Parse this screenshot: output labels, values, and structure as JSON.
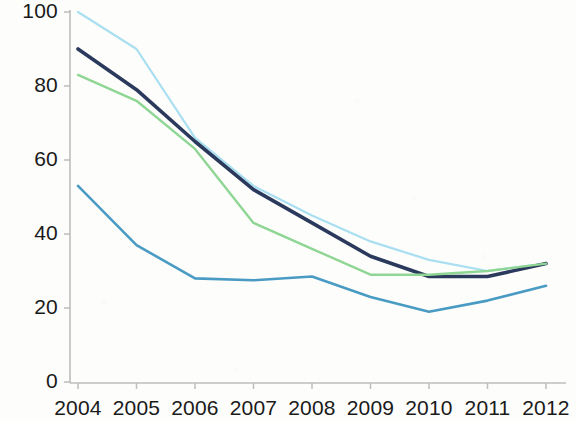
{
  "chart_data": {
    "type": "line",
    "title": "",
    "subtitle": "",
    "xlabel": "",
    "ylabel": "",
    "categories": [
      "2004",
      "2005",
      "2006",
      "2007",
      "2008",
      "2009",
      "2010",
      "2011",
      "2012"
    ],
    "x_tick_labels": [
      "2004",
      "2005",
      "2006",
      "2007",
      "2008",
      "2009",
      "2010",
      "2011",
      "2012"
    ],
    "y_tick_labels": [
      "0",
      "20",
      "40",
      "60",
      "80",
      "100"
    ],
    "y_ticks": [
      0,
      20,
      40,
      60,
      80,
      100
    ],
    "ylim": [
      0,
      100
    ],
    "xlim": [
      "2004",
      "2012"
    ],
    "grid": false,
    "legend": "none",
    "legend_position": "none",
    "annotations": [],
    "series": [
      {
        "name": "series-light-cyan",
        "color": "#a9dff1",
        "values": [
          100,
          90,
          66,
          53,
          45,
          38,
          33,
          30,
          32
        ]
      },
      {
        "name": "series-dark-navy",
        "color": "#2b3a5c",
        "values": [
          90,
          79,
          65,
          52,
          43,
          34,
          28.5,
          28.5,
          32
        ]
      },
      {
        "name": "series-light-green",
        "color": "#8fd694",
        "values": [
          83,
          76,
          63,
          43,
          36,
          29,
          29,
          30,
          32
        ]
      },
      {
        "name": "series-medium-blue",
        "color": "#4a9bc4",
        "values": [
          53,
          37,
          28,
          27.5,
          28.5,
          23,
          19,
          22,
          26
        ]
      }
    ],
    "axis_color": "#b9b9b9"
  },
  "axes": {
    "y_labels": [
      "100",
      "80",
      "60",
      "40",
      "20",
      "0"
    ],
    "x_labels": [
      "2004",
      "2005",
      "2006",
      "2007",
      "2008",
      "2009",
      "2010",
      "2011",
      "2012"
    ]
  }
}
